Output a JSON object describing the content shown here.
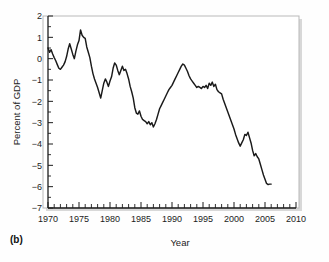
{
  "figure": {
    "panel_label": "(b)",
    "background": "#ffffff",
    "line_color": "#1a1a1a",
    "frame_color": "#b9b9b9"
  },
  "chart_data": {
    "type": "line",
    "title": "",
    "xlabel": "Year",
    "ylabel": "Percent of GDP",
    "xlim": [
      1970,
      2010
    ],
    "ylim": [
      -7,
      2
    ],
    "grid": false,
    "legend": null,
    "x_ticks": [
      1970,
      1975,
      1980,
      1985,
      1990,
      1995,
      2000,
      2005,
      2010
    ],
    "x_tick_labels": [
      "1970",
      "1975",
      "1980",
      "1985",
      "1990",
      "1995",
      "2000",
      "2005",
      "2010"
    ],
    "x_minor_tick_step": 1,
    "y_ticks": [
      2,
      1,
      0,
      -1,
      -2,
      -3,
      -4,
      -5,
      -6,
      -7
    ],
    "y_tick_labels": [
      "2",
      "1",
      "0",
      "-1",
      "-2",
      "-3",
      "-4",
      "-5",
      "-6",
      "-7"
    ],
    "y_minor_tick_step": 0.5,
    "series": [
      {
        "name": "Current account balance",
        "color": "#1a1a1a",
        "x": [
          1970.0,
          1970.25,
          1970.5,
          1970.75,
          1971.0,
          1971.25,
          1971.5,
          1971.75,
          1972.0,
          1972.25,
          1972.5,
          1972.75,
          1973.0,
          1973.25,
          1973.5,
          1973.75,
          1974.0,
          1974.25,
          1974.5,
          1974.75,
          1975.0,
          1975.25,
          1975.5,
          1975.75,
          1976.0,
          1976.25,
          1976.5,
          1976.75,
          1977.0,
          1977.25,
          1977.5,
          1977.75,
          1978.0,
          1978.25,
          1978.5,
          1978.75,
          1979.0,
          1979.25,
          1979.5,
          1979.75,
          1980.0,
          1980.25,
          1980.5,
          1980.75,
          1981.0,
          1981.25,
          1981.5,
          1981.75,
          1982.0,
          1982.25,
          1982.5,
          1982.75,
          1983.0,
          1983.25,
          1983.5,
          1983.75,
          1984.0,
          1984.25,
          1984.5,
          1984.75,
          1985.0,
          1985.25,
          1985.5,
          1985.75,
          1986.0,
          1986.25,
          1986.5,
          1986.75,
          1987.0,
          1987.25,
          1987.5,
          1987.75,
          1988.0,
          1988.25,
          1988.5,
          1988.75,
          1989.0,
          1989.25,
          1989.5,
          1989.75,
          1990.0,
          1990.25,
          1990.5,
          1990.75,
          1991.0,
          1991.25,
          1991.5,
          1991.75,
          1992.0,
          1992.25,
          1992.5,
          1992.75,
          1993.0,
          1993.25,
          1993.5,
          1993.75,
          1994.0,
          1994.25,
          1994.5,
          1994.75,
          1995.0,
          1995.25,
          1995.5,
          1995.75,
          1996.0,
          1996.25,
          1996.5,
          1996.75,
          1997.0,
          1997.25,
          1997.5,
          1997.75,
          1998.0,
          1998.25,
          1998.5,
          1998.75,
          1999.0,
          1999.25,
          1999.5,
          1999.75,
          2000.0,
          2000.25,
          2000.5,
          2000.75,
          2001.0,
          2001.25,
          2001.5,
          2001.75,
          2002.0,
          2002.25,
          2002.5,
          2002.75,
          2003.0,
          2003.25,
          2003.5,
          2003.75,
          2004.0,
          2004.25,
          2004.5,
          2004.75,
          2005.0,
          2005.25,
          2005.5,
          2005.75,
          2006.0
        ],
        "values": [
          0.5,
          0.3,
          0.42,
          0.22,
          0.05,
          -0.1,
          -0.28,
          -0.45,
          -0.5,
          -0.4,
          -0.3,
          -0.15,
          0.1,
          0.45,
          0.7,
          0.45,
          0.2,
          0.0,
          0.35,
          0.65,
          0.85,
          1.35,
          1.1,
          1.0,
          0.95,
          0.55,
          0.3,
          0.05,
          -0.35,
          -0.7,
          -0.95,
          -1.15,
          -1.35,
          -1.6,
          -1.85,
          -1.5,
          -1.15,
          -0.95,
          -1.1,
          -1.3,
          -1.05,
          -0.85,
          -0.45,
          -0.2,
          -0.3,
          -0.55,
          -0.75,
          -0.55,
          -0.35,
          -0.55,
          -0.5,
          -0.7,
          -0.95,
          -1.3,
          -1.55,
          -1.85,
          -2.3,
          -2.55,
          -2.6,
          -2.45,
          -2.7,
          -2.85,
          -2.9,
          -2.95,
          -3.05,
          -2.95,
          -3.1,
          -3.0,
          -3.2,
          -3.05,
          -2.85,
          -2.6,
          -2.35,
          -2.2,
          -2.05,
          -1.9,
          -1.75,
          -1.6,
          -1.45,
          -1.35,
          -1.25,
          -1.1,
          -0.95,
          -0.8,
          -0.65,
          -0.5,
          -0.35,
          -0.25,
          -0.3,
          -0.45,
          -0.6,
          -0.8,
          -0.95,
          -1.05,
          -1.15,
          -1.25,
          -1.35,
          -1.3,
          -1.35,
          -1.4,
          -1.3,
          -1.35,
          -1.25,
          -1.4,
          -1.15,
          -1.25,
          -1.1,
          -1.3,
          -1.2,
          -1.45,
          -1.55,
          -1.6,
          -1.65,
          -1.9,
          -2.1,
          -2.3,
          -2.5,
          -2.7,
          -2.9,
          -3.1,
          -3.3,
          -3.55,
          -3.75,
          -3.95,
          -4.1,
          -3.95,
          -3.8,
          -3.55,
          -3.6,
          -3.45,
          -3.7,
          -3.95,
          -4.3,
          -4.55,
          -4.45,
          -4.6,
          -4.7,
          -4.95,
          -5.2,
          -5.45,
          -5.65,
          -5.85,
          -5.9,
          -5.88,
          -5.88
        ]
      }
    ],
    "annotations": [
      {
        "text": "(b)",
        "role": "panel-label"
      }
    ]
  }
}
